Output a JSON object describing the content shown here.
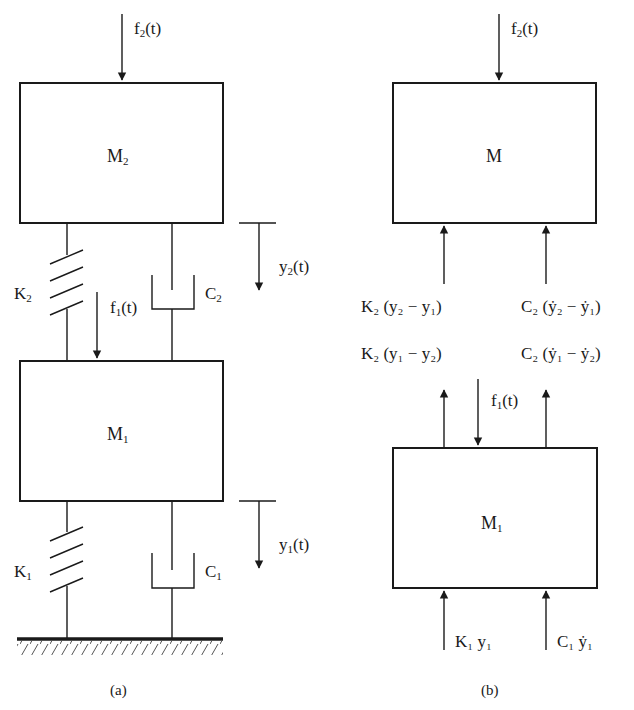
{
  "figure_a": {
    "caption": "(a)",
    "mass_top": {
      "name": "M",
      "sub": "2"
    },
    "mass_bottom": {
      "name": "M",
      "sub": "1"
    },
    "force_top": {
      "pre": "f",
      "sub": "2",
      "post": "(t)"
    },
    "force_mid": {
      "pre": "f",
      "sub": "1",
      "post": "(t)"
    },
    "spring_top": {
      "name": "K",
      "sub": "2"
    },
    "spring_bottom": {
      "name": "K",
      "sub": "1"
    },
    "damper_top": {
      "name": "C",
      "sub": "2"
    },
    "damper_bottom": {
      "name": "C",
      "sub": "1"
    },
    "disp_top": {
      "pre": "y",
      "sub": "2",
      "post": "(t)"
    },
    "disp_bottom": {
      "pre": "y",
      "sub": "1",
      "post": "(t)"
    }
  },
  "figure_b": {
    "caption": "(b)",
    "mass_top": {
      "name": "M"
    },
    "mass_bottom": {
      "name": "M",
      "sub": "1"
    },
    "force_top": {
      "pre": "f",
      "sub": "2",
      "post": "(t)"
    },
    "force_mid": {
      "pre": "f",
      "sub": "1",
      "post": "(t)"
    },
    "spring_force_on_top": "K₂ (y₂ − y₁)",
    "damper_force_on_top": "C₂ (ẏ₂ − ẏ₁)",
    "spring_force_on_bottom": "K₂ (y₁ − y₂)",
    "damper_force_on_bottom": "C₂ (ẏ₁ − ẏ₂)",
    "ground_spring_force": "K₁ y₁",
    "ground_damper_force": "C₁ ẏ₁"
  }
}
